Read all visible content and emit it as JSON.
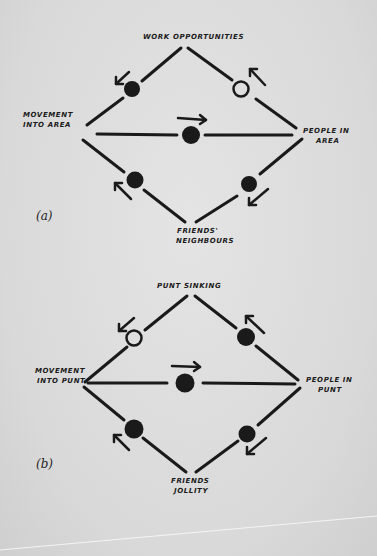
{
  "colors": {
    "paper": "#dcdcdc",
    "ink": "#1a1a1a"
  },
  "diagrams": [
    {
      "id": "a",
      "panel_label": "(a)",
      "nodes": {
        "top": "WORK OPPORTUNITIES",
        "left_line1": "MOVEMENT",
        "left_line2": "INTO AREA",
        "right_line1": "PEOPLE IN",
        "right_line2": "AREA",
        "bottom_line1": "FRIENDS'",
        "bottom_line2": "NEIGHBOURS"
      },
      "links": [
        {
          "edge": "top-left",
          "marker": "filled",
          "arrow": "down-left"
        },
        {
          "edge": "top-right",
          "marker": "open",
          "arrow": "up-left"
        },
        {
          "edge": "center",
          "marker": "filled",
          "arrow": "right"
        },
        {
          "edge": "bottom-left",
          "marker": "filled",
          "arrow": "up-left"
        },
        {
          "edge": "bottom-right",
          "marker": "filled",
          "arrow": "down-left"
        }
      ]
    },
    {
      "id": "b",
      "panel_label": "(b)",
      "nodes": {
        "top": "PUNT SINKING",
        "left_line1": "MOVEMENT",
        "left_line2": "INTO PUNT",
        "right_line1": "PEOPLE IN",
        "right_line2": "PUNT",
        "bottom_line1": "FRIENDS",
        "bottom_line2": "JOLLITY"
      },
      "links": [
        {
          "edge": "top-left",
          "marker": "open",
          "arrow": "down-left"
        },
        {
          "edge": "top-right",
          "marker": "filled",
          "arrow": "up-left"
        },
        {
          "edge": "center",
          "marker": "filled",
          "arrow": "right"
        },
        {
          "edge": "bottom-left",
          "marker": "filled",
          "arrow": "up-left"
        },
        {
          "edge": "bottom-right",
          "marker": "filled",
          "arrow": "down-left"
        }
      ]
    }
  ]
}
